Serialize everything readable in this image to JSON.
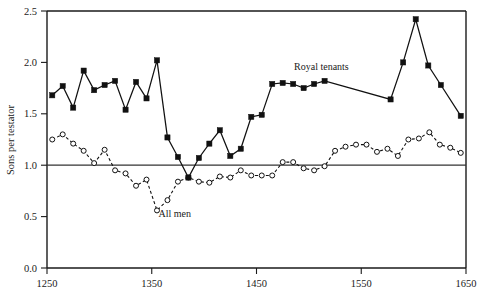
{
  "chart_data": {
    "type": "line",
    "title": "",
    "subtitle": "",
    "xlabel": "",
    "ylabel": "Sons per testator",
    "xlim": [
      1250,
      1650
    ],
    "ylim": [
      0.0,
      2.5
    ],
    "xticks": [
      1250,
      1350,
      1450,
      1550,
      1650
    ],
    "xtick_labels": [
      "1250",
      "1350",
      "1450",
      "1550",
      "1650"
    ],
    "yticks": [
      0.0,
      0.5,
      1.0,
      1.5,
      2.0,
      2.5
    ],
    "ytick_labels": [
      "0.0",
      "0.5",
      "1.0",
      "1.5",
      "2.0",
      "2.5"
    ],
    "grid": false,
    "legend_position": "inline-annotations",
    "reference_lines": [
      {
        "name": "replacement-level",
        "axis": "y",
        "value": 1.0,
        "style": "solid"
      }
    ],
    "annotations": [
      {
        "name": "royal-tenants-label",
        "text": "Royal tenants",
        "x": 1512,
        "y": 1.93
      },
      {
        "name": "all-men-label",
        "text": "All men",
        "x": 1372,
        "y": 0.5
      }
    ],
    "series": [
      {
        "name": "Royal tenants",
        "marker": "filled-square",
        "line_style": "solid",
        "color": "#111111",
        "x": [
          1255,
          1265,
          1275,
          1285,
          1295,
          1305,
          1315,
          1325,
          1335,
          1345,
          1355,
          1365,
          1375,
          1385,
          1395,
          1405,
          1415,
          1425,
          1435,
          1445,
          1455,
          1465,
          1475,
          1485,
          1495,
          1505,
          1515,
          1578,
          1590,
          1602,
          1614,
          1626
        ],
        "values": [
          1.68,
          1.77,
          1.56,
          1.92,
          1.73,
          1.78,
          1.82,
          1.54,
          1.81,
          1.65,
          2.02,
          1.27,
          1.08,
          0.88,
          1.07,
          1.21,
          1.34,
          1.09,
          1.16,
          1.47,
          1.49,
          1.79,
          1.8,
          1.79,
          1.75,
          1.79,
          1.82,
          1.64,
          2.0,
          2.42,
          1.97,
          1.78
        ]
      },
      {
        "name": "All men",
        "marker": "open-circle",
        "line_style": "dashed",
        "color": "#111111",
        "x": [
          1255,
          1265,
          1275,
          1285,
          1295,
          1305,
          1315,
          1325,
          1335,
          1345,
          1355,
          1365,
          1375,
          1385,
          1395,
          1405,
          1415,
          1425,
          1435,
          1445,
          1455,
          1465,
          1475,
          1485,
          1495,
          1505,
          1515,
          1525,
          1535,
          1545,
          1555,
          1565,
          1575,
          1585,
          1595,
          1605,
          1615,
          1625,
          1635,
          1645
        ],
        "values": [
          1.25,
          1.3,
          1.21,
          1.14,
          1.02,
          1.15,
          0.95,
          0.92,
          0.8,
          0.86,
          0.56,
          0.66,
          0.84,
          0.88,
          0.84,
          0.83,
          0.89,
          0.88,
          0.95,
          0.9,
          0.9,
          0.9,
          1.03,
          1.03,
          0.97,
          0.95,
          0.99,
          1.14,
          1.18,
          1.2,
          1.2,
          1.13,
          1.16,
          1.09,
          1.25,
          1.26,
          1.32,
          1.2,
          1.17,
          1.12
        ]
      }
    ],
    "tail_points": {
      "royal_tail_note": "final segment drops to 1.48 at 1645",
      "royal_final_x": 1645,
      "royal_final_value": 1.48
    }
  },
  "figure": {
    "background_color": "#ffffff",
    "axis_color": "#1a1a1a",
    "plot_left_px": 47,
    "plot_right_px": 466,
    "plot_top_px": 11,
    "plot_bottom_px": 268
  }
}
